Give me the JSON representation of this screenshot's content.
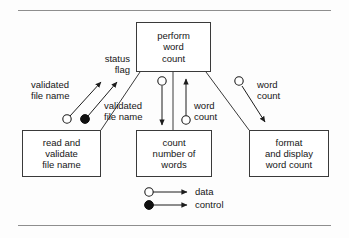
{
  "figure": {
    "type": "structure-chart",
    "background": "#fdfdfd",
    "line_color": "#3a3a3a",
    "rule_color": "#8e8e8e",
    "text_color": "#161616"
  },
  "rules": {
    "top": "",
    "bottom": ""
  },
  "modules": [
    {
      "id": "perform-word-count",
      "lines": [
        "perform",
        "word",
        "count"
      ],
      "x": 136,
      "y": 22,
      "w": 75,
      "h": 50
    },
    {
      "id": "read-and-validate-file-name",
      "lines": [
        "read and",
        "validate",
        "file name"
      ],
      "x": 22,
      "y": 130,
      "w": 79,
      "h": 47
    },
    {
      "id": "count-number-of-words",
      "lines": [
        "count",
        "number of",
        "words"
      ],
      "x": 136,
      "y": 130,
      "w": 76,
      "h": 47
    },
    {
      "id": "format-and-display-word-count",
      "lines": [
        "format",
        "and display",
        "word count"
      ],
      "x": 249,
      "y": 130,
      "w": 80,
      "h": 47
    }
  ],
  "couples": [
    {
      "id": "validated-file-name-up",
      "lines": [
        "validated",
        "file name"
      ],
      "kind": "data",
      "direction": "up-right"
    },
    {
      "id": "status-flag",
      "lines": [
        "status",
        "flag"
      ],
      "kind": "control",
      "direction": "up-right"
    },
    {
      "id": "validated-file-name-down",
      "lines": [
        "validated",
        "file name"
      ],
      "kind": "data",
      "direction": "down"
    },
    {
      "id": "word-count-up",
      "lines": [
        "word",
        "count"
      ],
      "kind": "data",
      "direction": "up"
    },
    {
      "id": "word-count-right",
      "lines": [
        "word",
        "count"
      ],
      "kind": "data",
      "direction": "down-right"
    }
  ],
  "legend": {
    "items": [
      {
        "id": "data",
        "label": "data",
        "marker": "hollow-circle"
      },
      {
        "id": "control",
        "label": "control",
        "marker": "filled-circle"
      }
    ]
  }
}
